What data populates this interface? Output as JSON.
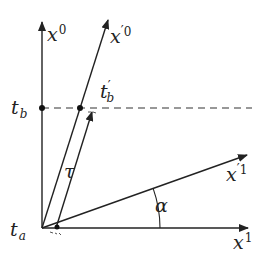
{
  "diagram": {
    "colors": {
      "line": "#222222",
      "background": "#ffffff"
    },
    "axes": {
      "x0": {
        "base": "x",
        "sup": "0"
      },
      "x0_prime": {
        "base": "x",
        "prime": "′",
        "sup": "0"
      },
      "x1": {
        "base": "x",
        "sup": "1"
      },
      "x1_prime": {
        "base": "x",
        "prime": "′",
        "sup": "1"
      }
    },
    "labels": {
      "t_a": {
        "base": "t",
        "sub": "a"
      },
      "t_b": {
        "base": "t",
        "sub": "b"
      },
      "t_b_prime": {
        "base": "t",
        "prime": "′",
        "sub": "b"
      },
      "tau": "τ",
      "alpha": "α"
    }
  }
}
